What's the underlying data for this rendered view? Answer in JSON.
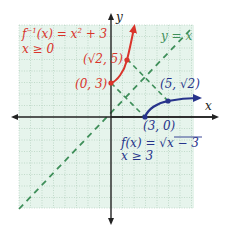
{
  "figure": {
    "axes": {
      "x_label": "x",
      "y_label": "y"
    },
    "colors": {
      "grid_fill": "#e6f4ec",
      "grid_line": "#a9c9b6",
      "axis": "#222222",
      "inverse": "#d9342b",
      "function": "#27348b",
      "identity": "#3f8f5a"
    },
    "identity_line": {
      "label": "y = x"
    },
    "inverse_function": {
      "label_fn": "f",
      "label_sup": "−1",
      "label_rest": "(x) = x",
      "label_exp": "2",
      "label_tail": " + 3",
      "domain": "x ≥ 0",
      "points": [
        {
          "label": "(0, 3)",
          "x": 0,
          "y": 3
        },
        {
          "label": "(√2, 5)",
          "x": 1.414,
          "y": 5
        }
      ]
    },
    "function": {
      "label": "f(x) = √x − 3",
      "label_left": "f(x) = ",
      "label_radical": "x − 3",
      "domain": "x ≥ 3",
      "points": [
        {
          "label": "(3, 0)",
          "x": 3,
          "y": 0
        },
        {
          "label": "(5, √2)",
          "x": 5,
          "y": 1.414
        }
      ]
    }
  }
}
